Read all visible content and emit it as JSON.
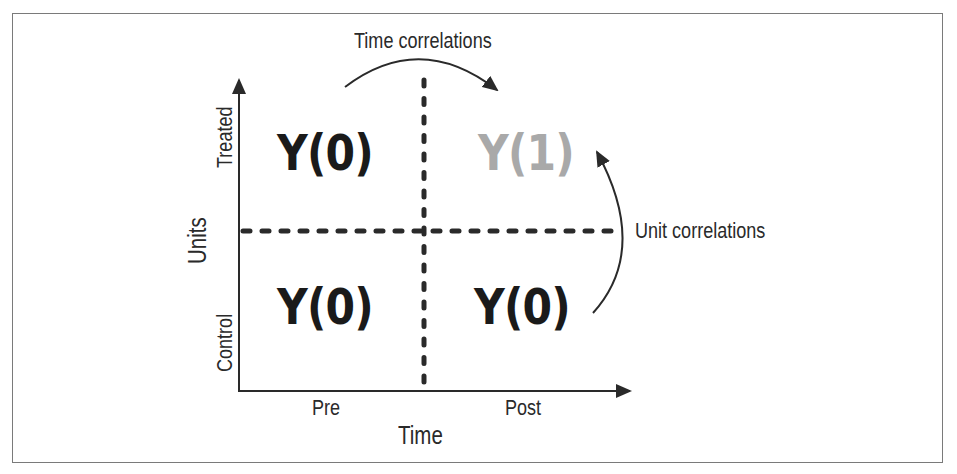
{
  "diagram": {
    "axes": {
      "x_label": "Time",
      "y_label": "Units",
      "x_ticks": [
        "Pre",
        "Post"
      ],
      "y_ticks": [
        "Control",
        "Treated"
      ]
    },
    "cells": {
      "treated_pre": "Y(0)",
      "treated_post": "Y(1)",
      "control_pre": "Y(0)",
      "control_post": "Y(0)"
    },
    "annotations": {
      "time_correlations": "Time correlations",
      "unit_correlations": "Unit correlations"
    },
    "colors": {
      "ink": "#1a1a1a",
      "counterfactual": "#a9a9a9",
      "frame": "#7a7a7a"
    }
  }
}
